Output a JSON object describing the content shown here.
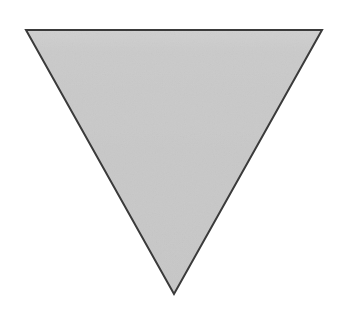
{
  "canvas": {
    "width": 348,
    "height": 319,
    "background_color": "#ffffff",
    "description": "Single inverted triangle shape on a plain white background"
  },
  "figure": {
    "name": "inverted-triangle",
    "label": "Inverted triangle",
    "shape_type": "triangle",
    "orientation": "pointing-down",
    "sides": 3,
    "fill_color": "#c8c8c8",
    "fill_highlight_color": "#d6d6d6",
    "stroke_color": "#3a3a3a",
    "stroke_width": 2,
    "texture": "fine-grain-noise",
    "vertices": [
      {
        "name": "top-left",
        "x": 26,
        "y": 30
      },
      {
        "name": "top-right",
        "x": 322,
        "y": 30
      },
      {
        "name": "bottom-apex",
        "x": 174,
        "y": 294
      }
    ],
    "points_attr": "26,30 322,30 174,294",
    "bounding_box": {
      "x": 26,
      "y": 30,
      "width": 296,
      "height": 264
    },
    "top_edge_y": 30,
    "apex_y": 294,
    "base_width": 296
  }
}
